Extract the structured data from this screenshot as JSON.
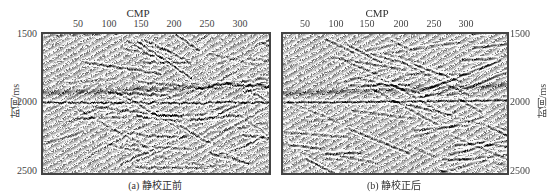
{
  "figure": {
    "panels": [
      {
        "id": "a",
        "caption": "(a)  静校正前",
        "x_axis_title": "CMP",
        "x_ticks": [
          "50",
          "100",
          "150",
          "200",
          "250",
          "300"
        ],
        "y_ticks": [
          "1500",
          "2000",
          "2500"
        ],
        "y_axis_label": "时间/ms",
        "y_axis_side": "left"
      },
      {
        "id": "b",
        "caption": "(b)  静校正后",
        "x_axis_title": "CMP",
        "x_ticks": [
          "50",
          "100",
          "150",
          "200",
          "250",
          "300"
        ],
        "y_ticks": [
          "1500",
          "2000",
          "2500"
        ],
        "y_axis_label": "时间/ms",
        "y_axis_side": "right"
      }
    ]
  },
  "chart_data": [
    {
      "type": "heatmap",
      "title": "(a) 静校正前",
      "description": "Seismic stacked section before static correction (grayscale wiggle/variable density)",
      "xlabel": "CMP",
      "ylabel": "时间/ms",
      "x_ticks": [
        50,
        100,
        150,
        200,
        250,
        300
      ],
      "y_ticks": [
        1500,
        2000,
        2500
      ],
      "xlim": [
        25,
        345
      ],
      "ylim": [
        2500,
        1500
      ],
      "colormap": "gray",
      "dominant_reflector_ms": 2000
    },
    {
      "type": "heatmap",
      "title": "(b) 静校正后",
      "description": "Seismic stacked section after static correction; reflectors more continuous",
      "xlabel": "CMP",
      "ylabel": "时间/ms",
      "x_ticks": [
        50,
        100,
        150,
        200,
        250,
        300
      ],
      "y_ticks": [
        1500,
        2000,
        2500
      ],
      "xlim": [
        25,
        345
      ],
      "ylim": [
        2500,
        1500
      ],
      "colormap": "gray",
      "dominant_reflector_ms": 2000
    }
  ]
}
